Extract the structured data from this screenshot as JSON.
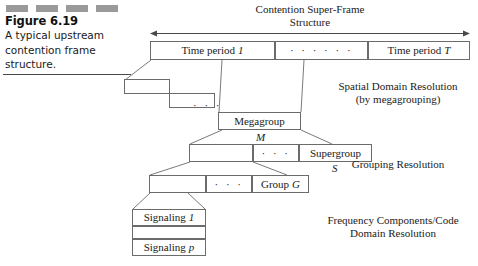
{
  "figure": {
    "number": "Figure 6.19",
    "caption_lines": [
      "A typical upstream",
      "contention frame",
      "structure."
    ],
    "deco_bar_count": 4,
    "deco_bar_color": "#9a9a9a"
  },
  "superframe": {
    "title_line1": "Contention Super-Frame",
    "title_line2": "Structure",
    "cells": [
      {
        "label": "Time period",
        "index": "1"
      },
      {
        "label": "· · · · · ·",
        "index": ""
      },
      {
        "label": "Time period",
        "index": "T"
      }
    ]
  },
  "stepped_boxes": {
    "ellipsis": "· · ·"
  },
  "megagroup": {
    "label": "Megagroup",
    "sublabel": "M"
  },
  "supergroup_row": {
    "ellipsis": "· · ·",
    "label": "Supergroup",
    "sublabel": "S"
  },
  "group_row": {
    "ellipsis": "· · ·",
    "label": "Group",
    "index": "G"
  },
  "signaling_stack": {
    "rows": [
      {
        "label": "Signaling",
        "index": "1"
      },
      {
        "label": "",
        "index": ""
      },
      {
        "label": "Signaling",
        "index": "p"
      }
    ]
  },
  "resolution_labels": {
    "spatial_line1": "Spatial Domain Resolution",
    "spatial_line2": "(by megagrouping)",
    "grouping": "Grouping Resolution",
    "frequency_line1": "Frequency Components/Code",
    "frequency_line2": "Domain Resolution"
  },
  "colors": {
    "line": "#6b6b6b",
    "text": "#1a1a1a",
    "background": "#ffffff"
  }
}
